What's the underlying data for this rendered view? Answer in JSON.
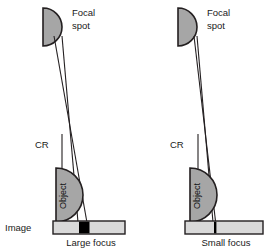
{
  "figure": {
    "title_present": false,
    "background_color": "#ffffff",
    "stroke_color": "#231f20",
    "fill_gray": "#a6a6a6",
    "fill_light_gray": "#d9d9d9",
    "fill_black": "#000000"
  },
  "panels": [
    {
      "id": "left",
      "caption": "Large focus",
      "focal_spot_label_line1": "Focal",
      "focal_spot_label_line2": "spot",
      "cr_label": "CR",
      "image_label": "Image",
      "object_label": "Object",
      "focal_spot_size": "large",
      "penumbra": "wide"
    },
    {
      "id": "right",
      "caption": "Small focus",
      "focal_spot_label_line1": "Focal",
      "focal_spot_label_line2": "spot",
      "cr_label": "CR",
      "image_label": "",
      "object_label": "Object",
      "focal_spot_size": "small",
      "penumbra": "narrow"
    }
  ],
  "labels": {
    "focal_line1": "Focal",
    "focal_line2": "spot",
    "cr": "CR",
    "image": "Image",
    "object": "Object",
    "caption_left": "Large focus",
    "caption_right": "Small focus"
  }
}
